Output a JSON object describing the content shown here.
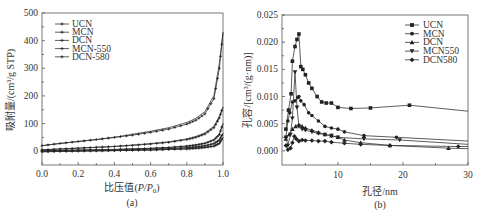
{
  "chart_data": [
    {
      "id": "a",
      "type": "line",
      "caption": "(a)",
      "title": "",
      "xlabel": "比压值(P/P0)",
      "ylabel": "吸附量/(cm³/g STP)",
      "xlim": [
        0.0,
        1.0
      ],
      "ylim": [
        -50,
        500
      ],
      "xticks": [
        "0.0",
        "0.2",
        "0.4",
        "0.6",
        "0.8",
        "1.0"
      ],
      "yticks": [
        "0",
        "100",
        "200",
        "300",
        "400",
        "500"
      ],
      "grid": false,
      "legend_position": "upper left",
      "legend": [
        "UCN",
        "MCN",
        "DCN",
        "MCN-550",
        "DCN-580"
      ],
      "x": [
        0.0,
        0.1,
        0.2,
        0.3,
        0.4,
        0.5,
        0.6,
        0.7,
        0.8,
        0.85,
        0.9,
        0.95,
        0.98,
        1.0
      ],
      "series": [
        {
          "name": "UCN",
          "values": [
            20,
            28,
            35,
            42,
            50,
            58,
            68,
            80,
            98,
            112,
            135,
            190,
            300,
            430
          ]
        },
        {
          "name": "MCN",
          "values": [
            5,
            8,
            11,
            14,
            17,
            21,
            26,
            32,
            42,
            50,
            62,
            85,
            120,
            160
          ]
        },
        {
          "name": "DCN",
          "values": [
            2,
            3,
            4,
            5,
            6,
            8,
            10,
            13,
            18,
            22,
            28,
            40,
            60,
            100
          ]
        },
        {
          "name": "MCN-550",
          "values": [
            0,
            1,
            2,
            3,
            4,
            5,
            7,
            9,
            12,
            15,
            19,
            27,
            40,
            65
          ]
        },
        {
          "name": "DCN-580",
          "values": [
            -2,
            -1,
            0,
            1,
            2,
            3,
            4,
            6,
            8,
            10,
            13,
            18,
            28,
            50
          ]
        }
      ]
    },
    {
      "id": "b",
      "type": "line",
      "caption": "(b)",
      "title": "",
      "xlabel": "孔径/nm",
      "ylabel": "孔容/[cm³/(g·nm)]",
      "xlim": [
        1.4,
        30
      ],
      "ylim": [
        -0.0026,
        0.025
      ],
      "xticks": [
        "10",
        "20",
        "30"
      ],
      "yticks": [
        "0.000",
        "0.005",
        "0.010",
        "0.015",
        "0.020",
        "0.025"
      ],
      "grid": false,
      "legend_position": "upper right",
      "legend": [
        "UCN",
        "MCN",
        "DCN",
        "MCN550",
        "DCN580"
      ],
      "series": [
        {
          "name": "UCN",
          "marker": "square",
          "x": [
            2.0,
            2.4,
            2.8,
            3.0,
            3.4,
            3.7,
            4.0,
            4.3,
            4.6,
            5.0,
            5.5,
            6.0,
            6.8,
            7.5,
            8.2,
            9.0,
            10.0,
            12.0,
            15.0,
            21.0,
            30.0
          ],
          "y": [
            0.004,
            0.0075,
            0.0105,
            0.0165,
            0.0192,
            0.0205,
            0.0215,
            0.0155,
            0.015,
            0.014,
            0.0125,
            0.0115,
            0.01,
            0.009,
            0.0088,
            0.0088,
            0.008,
            0.0078,
            0.0079,
            0.0084,
            0.0073
          ]
        },
        {
          "name": "MCN",
          "marker": "circle",
          "x": [
            2.0,
            2.3,
            2.6,
            3.0,
            3.4,
            3.8,
            4.0,
            4.3,
            4.8,
            5.5,
            6.0,
            7.0,
            8.0,
            9.0,
            10.0,
            11.0,
            14.0,
            19.0,
            30.0
          ],
          "y": [
            0.0025,
            0.0055,
            0.007,
            0.009,
            0.0092,
            0.0098,
            0.01,
            0.0092,
            0.0085,
            0.007,
            0.0065,
            0.0055,
            0.0045,
            0.0042,
            0.004,
            0.0035,
            0.0028,
            0.0025,
            0.0018
          ]
        },
        {
          "name": "DCN",
          "marker": "triangle-up",
          "x": [
            2.0,
            2.5,
            3.0,
            3.5,
            4.0,
            4.5,
            5.0,
            6.0,
            7.0,
            8.0,
            9.0,
            10.0,
            11.0,
            13.5,
            18.0,
            27.0,
            30.0
          ],
          "y": [
            0.0022,
            0.003,
            0.004,
            0.0045,
            0.0048,
            0.0045,
            0.0042,
            0.0038,
            0.0034,
            0.003,
            0.0028,
            0.0025,
            0.002,
            0.0015,
            0.001,
            0.0005,
            0.0004
          ]
        },
        {
          "name": "MCN550",
          "marker": "triangle-down",
          "x": [
            2.0,
            2.3,
            2.7,
            3.0,
            3.4,
            3.7,
            4.0,
            4.5,
            5.0,
            6.0,
            7.0,
            8.0,
            9.0,
            10.0,
            14.0,
            19.5,
            30.0
          ],
          "y": [
            0.0025,
            0.001,
            0.003,
            0.006,
            0.0145,
            0.008,
            0.0045,
            0.004,
            0.0038,
            0.0035,
            0.0032,
            0.003,
            0.0028,
            0.0025,
            0.0022,
            0.002,
            0.0012
          ]
        },
        {
          "name": "DCN580",
          "marker": "diamond",
          "x": [
            2.0,
            2.3,
            2.7,
            3.0,
            3.3,
            3.6,
            4.0,
            4.5,
            5.0,
            6.0,
            7.0,
            8.0,
            9.0,
            11.0,
            13.5,
            18.0,
            28.5,
            30.0
          ],
          "y": [
            0.001,
            0.0002,
            0.0005,
            0.0015,
            0.0027,
            0.0022,
            0.0018,
            0.002,
            0.0019,
            0.0019,
            0.0018,
            0.0018,
            0.0016,
            0.0014,
            0.0012,
            0.001,
            0.0008,
            0.0008
          ]
        }
      ]
    }
  ],
  "figure": {
    "a": {
      "caption": "(a)",
      "xlabel_prefix": "比压值(",
      "xlabel_var": "P/P",
      "xlabel_sub": "0",
      "xlabel_suffix": ")",
      "ylabel": "吸附量/(cm³/g STP)"
    },
    "b": {
      "caption": "(b)",
      "xlabel": "孔径/nm",
      "ylabel": "孔容/[cm³/(g·nm)]"
    }
  }
}
